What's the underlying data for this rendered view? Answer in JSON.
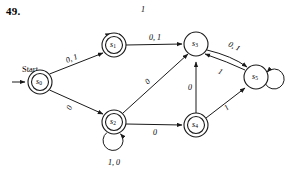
{
  "figure": {
    "problem_number": "49.",
    "type": "finite-state-machine-diagram",
    "start_label": "Start"
  },
  "states": [
    {
      "id": "s0",
      "name": "s",
      "sub": "0",
      "x": 40,
      "y": 82,
      "accepting": true,
      "r_outer": 12,
      "r_inner": 8.5
    },
    {
      "id": "s1",
      "name": "s",
      "sub": "1",
      "x": 114,
      "y": 45,
      "accepting": true,
      "r_outer": 12,
      "r_inner": 8.5
    },
    {
      "id": "s2",
      "name": "s",
      "sub": "2",
      "x": 114,
      "y": 122,
      "accepting": true,
      "r_outer": 12,
      "r_inner": 8.5
    },
    {
      "id": "s3",
      "name": "s",
      "sub": "3",
      "x": 196,
      "y": 44,
      "accepting": false,
      "r_outer": 12,
      "r_inner": 0
    },
    {
      "id": "s4",
      "name": "s",
      "sub": "4",
      "x": 196,
      "y": 125,
      "accepting": true,
      "r_outer": 12,
      "r_inner": 8.5
    },
    {
      "id": "s5",
      "name": "s",
      "sub": "5",
      "x": 256,
      "y": 77,
      "accepting": false,
      "r_outer": 12,
      "r_inner": 0
    }
  ],
  "transitions": [
    {
      "from": "start",
      "to": "s0",
      "label": "",
      "label_x": 0,
      "label_y": 0
    },
    {
      "from": "s0",
      "to": "s1",
      "label": "0, 1",
      "label_x": 72,
      "label_y": 59
    },
    {
      "from": "s0",
      "to": "s2",
      "label": "0",
      "label_x": 72,
      "label_y": 106
    },
    {
      "from": "s1",
      "to": "s1",
      "label": "1",
      "label_x": 142,
      "label_y": 12
    },
    {
      "from": "s1",
      "to": "s3",
      "label": "0, 1",
      "label_x": 155,
      "label_y": 37
    },
    {
      "from": "s2",
      "to": "s2",
      "label": "1, 0",
      "label_x": 114,
      "label_y": 164
    },
    {
      "from": "s2",
      "to": "s3",
      "label": "0",
      "label_x": 151,
      "label_y": 82
    },
    {
      "from": "s2",
      "to": "s4",
      "label": "0",
      "label_x": 155,
      "label_y": 132
    },
    {
      "from": "s3",
      "to": "s5",
      "label": "0, 1",
      "label_x": 233,
      "label_y": 47
    },
    {
      "from": "s5",
      "to": "s3",
      "label": "1",
      "label_x": 219,
      "label_y": 72
    },
    {
      "from": "s4",
      "to": "s3",
      "label": "0",
      "label_x": 190,
      "label_y": 87
    },
    {
      "from": "s4",
      "to": "s5",
      "label": "1",
      "label_x": 228,
      "label_y": 106
    },
    {
      "from": "s5",
      "to": "s5",
      "label": "",
      "label_x": 0,
      "label_y": 0
    }
  ],
  "colors": {
    "stroke": "#1a1a1a",
    "background": "#ffffff",
    "text": "#000000"
  }
}
